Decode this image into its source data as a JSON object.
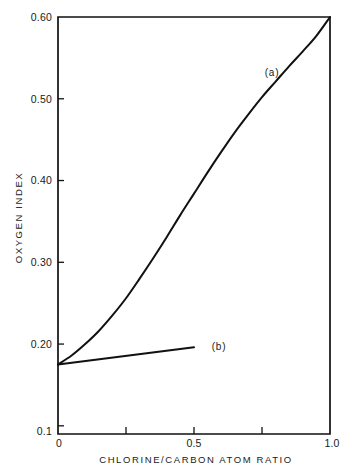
{
  "chart_data": {
    "type": "line",
    "title": "",
    "xlabel": "CHLORINE/CARBON ATOM RATIO",
    "ylabel": "OXYGEN INDEX",
    "xlim": [
      0.0,
      1.0
    ],
    "ylim": [
      0.09,
      0.6
    ],
    "grid": false,
    "legend": "inline-curve-labels",
    "x_tick_labels": [
      "0",
      "0.5",
      "1.0"
    ],
    "x_tick_values": [
      0.0,
      0.5,
      1.0
    ],
    "x_minor_tick_values": [
      0.25,
      0.75
    ],
    "y_tick_labels": [
      "0.60",
      "0.50",
      "0.40",
      "0.30",
      "0.20",
      "0.1"
    ],
    "y_tick_values": [
      0.6,
      0.5,
      0.4,
      0.3,
      0.2,
      0.1
    ],
    "series": [
      {
        "name": "(a)",
        "label": "(a)",
        "label_x": 0.76,
        "label_y": 0.5325,
        "x": [
          0.0,
          0.05,
          0.1,
          0.15,
          0.2,
          0.25,
          0.3,
          0.35,
          0.4,
          0.45,
          0.5,
          0.55,
          0.6,
          0.65,
          0.7,
          0.75,
          0.8,
          0.85,
          0.9,
          0.95,
          1.0
        ],
        "y": [
          0.175,
          0.186,
          0.2,
          0.216,
          0.235,
          0.256,
          0.28,
          0.305,
          0.331,
          0.358,
          0.384,
          0.41,
          0.435,
          0.459,
          0.481,
          0.502,
          0.521,
          0.54,
          0.558,
          0.577,
          0.6
        ]
      },
      {
        "name": "(b)",
        "label": "(b)",
        "label_x": 0.565,
        "label_y": 0.1965,
        "x": [
          0.0,
          0.5
        ],
        "y": [
          0.175,
          0.196
        ]
      }
    ]
  },
  "geometry": {
    "plot_left": 58,
    "plot_right": 330,
    "plot_top": 17,
    "plot_bottom": 434
  },
  "colors": {
    "background": "#ffffff",
    "ink": "#111111"
  }
}
